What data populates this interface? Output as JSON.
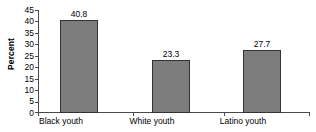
{
  "chart_data": {
    "type": "bar",
    "title": "",
    "subtitle": "",
    "xlabel": "",
    "ylabel": "Percent",
    "categories": [
      "Black youth",
      "White youth",
      "Latino youth"
    ],
    "values": [
      40.8,
      23.3,
      27.7
    ],
    "value_labels": [
      "40.8",
      "23.3",
      "27.7"
    ],
    "ylim": [
      0,
      45
    ],
    "ytick_step": 5,
    "ytick_labels": [
      "45",
      "40",
      "35",
      "30",
      "25",
      "20",
      "15",
      "10",
      "5",
      "0"
    ],
    "ytick_values": [
      45,
      40,
      35,
      30,
      25,
      20,
      15,
      10,
      5,
      0
    ],
    "grid": false,
    "legend": false,
    "legend_position": "none",
    "bar_fill_color": "#7d7d7d",
    "bar_border_color": "#333333",
    "axis_color": "#4a4a4a",
    "background_color": "#ffffff",
    "text_color": "#000000"
  }
}
